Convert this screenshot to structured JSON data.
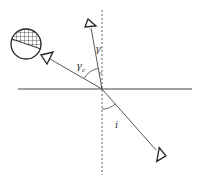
{
  "diagram": {
    "type": "ray-optics-angle-diagram",
    "colors": {
      "line": "#333333",
      "dash": "#555555",
      "background": "#ffffff"
    },
    "labels": {
      "gamma": "γ",
      "gamma_c_base": "γ",
      "gamma_c_sub": "c",
      "incidence": "i"
    },
    "elements": {
      "surface_line": "horizontal surface",
      "normal_line": "vertical dashed normal",
      "observer": "hatched sphere (eye/detector)"
    }
  }
}
